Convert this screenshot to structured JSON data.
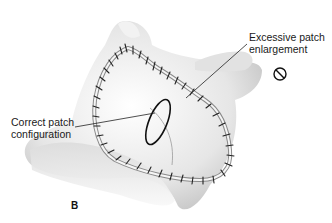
{
  "figure": {
    "panel_letter": "B",
    "labels": {
      "excessive_line1": "Excessive patch",
      "excessive_line2": "enlargement",
      "correct_line1": "Correct patch",
      "correct_line2": "configuration"
    },
    "icons": {
      "prohibited": "no-symbol-icon"
    },
    "colors": {
      "ink": "#1a1a1a",
      "tissue_light": "#f0f0f0",
      "tissue_mid": "#d2d2d2",
      "tissue_dark": "#a8a8a8",
      "background": "#ffffff"
    }
  }
}
